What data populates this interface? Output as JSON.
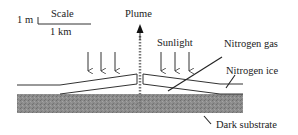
{
  "diagram": {
    "type": "cross-section schematic",
    "scale": {
      "title": "Scale",
      "vertical": "1 m",
      "horizontal": "1 km"
    },
    "labels": {
      "plume": "Plume",
      "sunlight": "Sunlight",
      "nitrogen_gas": "Nitrogen gas",
      "nitrogen_ice": "Nitrogen ice",
      "dark_substrate": "Dark substrate"
    },
    "colors": {
      "line": "#333333",
      "substrate": "#8a8a8a",
      "background": "#ffffff"
    },
    "sunlight_arrows": 6
  }
}
